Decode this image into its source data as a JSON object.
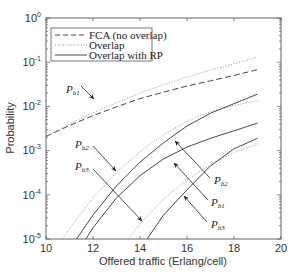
{
  "chart_data": {
    "type": "line",
    "title": "",
    "xlabel": "Offered traffic (Erlang/cell)",
    "ylabel": "Probability",
    "xlim": [
      10,
      20
    ],
    "ylim": [
      1e-05,
      1
    ],
    "yscale": "log",
    "grid": false,
    "legend_position": "upper left",
    "x_ticks": [
      "10",
      "12",
      "14",
      "16",
      "18",
      "20"
    ],
    "y_ticks": [
      "10^0",
      "10^-1",
      "10^-2",
      "10^-3",
      "10^-4",
      "10^-5"
    ],
    "legend": [
      {
        "label": "FCA (no overlap)",
        "style": "dashed"
      },
      {
        "label": "Overlap",
        "style": "dotted"
      },
      {
        "label": "Overlap with RP",
        "style": "solid"
      }
    ],
    "series": [
      {
        "name": "FCA (no overlap) Pb1",
        "style": "dashed",
        "x": [
          10,
          11,
          12,
          13,
          14,
          15,
          16,
          17,
          18,
          19
        ],
        "values": [
          0.0021,
          0.0037,
          0.0062,
          0.0098,
          0.015,
          0.021,
          0.029,
          0.038,
          0.05,
          0.068
        ]
      },
      {
        "name": "Overlap Pb1",
        "style": "dotted",
        "x": [
          10,
          11,
          12,
          13,
          14,
          15,
          16,
          17,
          18,
          19
        ],
        "values": [
          0.0021,
          0.004,
          0.0072,
          0.012,
          0.02,
          0.031,
          0.046,
          0.066,
          0.092,
          0.13
        ]
      },
      {
        "name": "Overlap Pb2",
        "style": "dotted",
        "x": [
          10.7,
          11,
          12,
          13,
          14,
          15,
          16,
          17,
          18,
          19
        ],
        "values": [
          1e-05,
          1.7e-05,
          8.5e-05,
          0.00032,
          0.00095,
          0.0023,
          0.0046,
          0.0076,
          0.0105,
          0.0135
        ]
      },
      {
        "name": "Overlap with RP Pb2",
        "style": "solid",
        "x": [
          11.3,
          12,
          13,
          14,
          15,
          16,
          17,
          18,
          19
        ],
        "values": [
          1e-05,
          3.5e-05,
          0.00016,
          0.00055,
          0.0015,
          0.0036,
          0.007,
          0.0115,
          0.019
        ]
      },
      {
        "name": "Overlap with RP Pb1",
        "style": "solid",
        "x": [
          11.7,
          12,
          13,
          14,
          15,
          16,
          17,
          18,
          19
        ],
        "values": [
          1e-05,
          1.8e-05,
          8.5e-05,
          0.00027,
          0.00065,
          0.0012,
          0.0019,
          0.0028,
          0.0042
        ]
      },
      {
        "name": "Overlap Pb3",
        "style": "dotted",
        "x": [
          13.5,
          14,
          15,
          16,
          17,
          18,
          19
        ],
        "values": [
          1e-05,
          2.2e-05,
          8e-05,
          0.00022,
          0.00048,
          0.0009,
          0.0014
        ]
      },
      {
        "name": "Overlap with RP Pb3",
        "style": "solid",
        "x": [
          14.3,
          15,
          16,
          17,
          18,
          19
        ],
        "values": [
          1e-05,
          3.5e-05,
          0.00013,
          0.00045,
          0.0011,
          0.0019
        ]
      }
    ],
    "annotations": [
      {
        "text": "P",
        "sub": "b1",
        "pos": "left",
        "target": "FCA/Overlap Pb1 near x=13"
      },
      {
        "text": "P",
        "sub": "b2",
        "pos": "left",
        "target": "Overlap Pb2 near x=13"
      },
      {
        "text": "P",
        "sub": "b3",
        "pos": "left",
        "target": "Overlap Pb3 near x=14"
      },
      {
        "text": "P",
        "sub": "b2",
        "pos": "right",
        "target": "RP Pb2 near x=15.4"
      },
      {
        "text": "P",
        "sub": "b1",
        "pos": "right",
        "target": "RP Pb1 near x=15.4"
      },
      {
        "text": "P",
        "sub": "b3",
        "pos": "right",
        "target": "RP Pb3 near x=15.8"
      }
    ]
  },
  "axes": {
    "xlabel": "Offered traffic (Erlang/cell)",
    "ylabel": "Probability",
    "x_tick_labels": [
      "10",
      "12",
      "14",
      "16",
      "18",
      "20"
    ],
    "y_tick_bases": [
      "10",
      "10",
      "10",
      "10",
      "10",
      "10"
    ],
    "y_tick_exps": [
      "0",
      "-1",
      "-2",
      "-3",
      "-4",
      "-5"
    ]
  },
  "legend": {
    "fca": "FCA (no overlap)",
    "overlap": "Overlap",
    "rp": "Overlap with RP"
  },
  "annotations": {
    "p": "P",
    "b1": "b1",
    "b2": "b2",
    "b3": "b3"
  }
}
